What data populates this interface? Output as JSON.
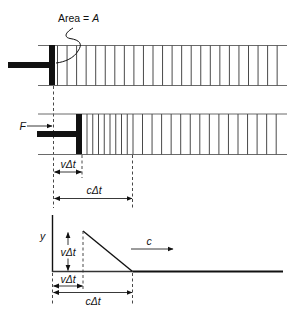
{
  "figure": {
    "panel_1": {
      "area_label": "Area = ",
      "area_symbol": "A"
    },
    "panel_2": {
      "force_label": "F",
      "piston_displacement_label": "vΔt",
      "wave_distance_label": "cΔt"
    },
    "panel_3": {
      "y_axis_label": "y",
      "height_label": "vΔt",
      "piston_displacement_label": "vΔt",
      "wave_distance_label": "cΔt",
      "wave_speed_label": "c"
    },
    "colors": {
      "ink": "#111111",
      "rail": "#6a6a6a",
      "slice": "#4a4a4a",
      "background": "#ffffff"
    }
  }
}
